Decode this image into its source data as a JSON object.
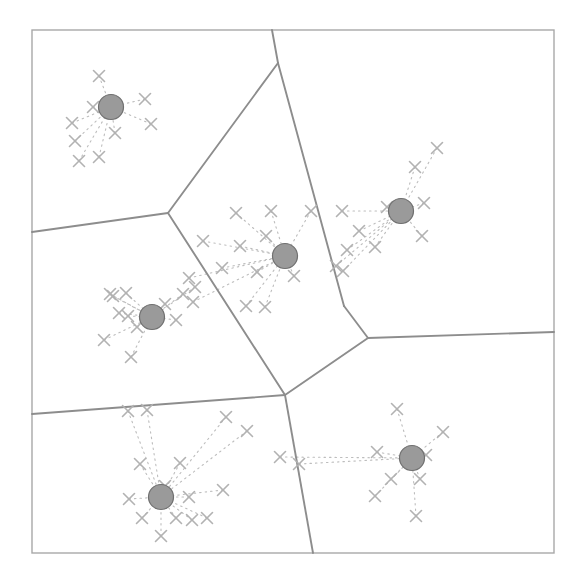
{
  "figure": {
    "title": "Voronoi partition of clustered scatter points",
    "type": "scatter-voronoi-diagram",
    "caption": "",
    "background_color": "#ffffff",
    "frame": {
      "x": 32,
      "y": 30,
      "width": 522,
      "height": 523,
      "stroke_color": "#a8a8a8",
      "stroke_width": 1.4
    },
    "style": {
      "centroid_fill": "#9a9a9a",
      "centroid_stroke": "#6f6f6f",
      "centroid_radius": 12.5,
      "point_color": "#b2b2b2",
      "point_size": 11,
      "boundary_color": "#8d8d8d",
      "boundary_width": 1.9,
      "assignment_line_color": "#bdbdbd",
      "assignment_line_width": 1.1,
      "assignment_dash": "1.5 4"
    }
  },
  "chart_data": {
    "type": "scatter",
    "title": "Voronoi partition of clustered scatter points",
    "xlabel": "",
    "ylabel": "",
    "xlim": [
      32,
      554
    ],
    "ylim": [
      30,
      553
    ],
    "grid": false,
    "legend": "none",
    "cluster_count": 5,
    "point_count": 89,
    "centroids": [
      {
        "id": "c1",
        "label": "cluster-1",
        "x": 111,
        "y": 107
      },
      {
        "id": "c2",
        "label": "cluster-2",
        "x": 401,
        "y": 211
      },
      {
        "id": "c3",
        "label": "cluster-3",
        "x": 285,
        "y": 256
      },
      {
        "id": "c4",
        "label": "cluster-4",
        "x": 152,
        "y": 317
      },
      {
        "id": "c5",
        "label": "cluster-5",
        "x": 412,
        "y": 458
      },
      {
        "id": "c6",
        "label": "cluster-6",
        "x": 161,
        "y": 497
      }
    ],
    "points": [
      {
        "x": 99,
        "y": 76,
        "cluster": "c1"
      },
      {
        "x": 72,
        "y": 123,
        "cluster": "c1"
      },
      {
        "x": 145,
        "y": 99,
        "cluster": "c1"
      },
      {
        "x": 93,
        "y": 107,
        "cluster": "c1"
      },
      {
        "x": 75,
        "y": 141,
        "cluster": "c1"
      },
      {
        "x": 79,
        "y": 161,
        "cluster": "c1"
      },
      {
        "x": 115,
        "y": 133,
        "cluster": "c1"
      },
      {
        "x": 151,
        "y": 124,
        "cluster": "c1"
      },
      {
        "x": 99,
        "y": 157,
        "cluster": "c1"
      },
      {
        "x": 437,
        "y": 148,
        "cluster": "c2"
      },
      {
        "x": 415,
        "y": 167,
        "cluster": "c2"
      },
      {
        "x": 424,
        "y": 203,
        "cluster": "c2"
      },
      {
        "x": 422,
        "y": 236,
        "cluster": "c2"
      },
      {
        "x": 387,
        "y": 207,
        "cluster": "c2"
      },
      {
        "x": 375,
        "y": 247,
        "cluster": "c2"
      },
      {
        "x": 347,
        "y": 250,
        "cluster": "c2"
      },
      {
        "x": 336,
        "y": 266,
        "cluster": "c2"
      },
      {
        "x": 342,
        "y": 211,
        "cluster": "c2"
      },
      {
        "x": 359,
        "y": 231,
        "cluster": "c2"
      },
      {
        "x": 343,
        "y": 271,
        "cluster": "c2"
      },
      {
        "x": 236,
        "y": 213,
        "cluster": "c3"
      },
      {
        "x": 271,
        "y": 211,
        "cluster": "c3"
      },
      {
        "x": 311,
        "y": 211,
        "cluster": "c3"
      },
      {
        "x": 266,
        "y": 236,
        "cluster": "c3"
      },
      {
        "x": 240,
        "y": 246,
        "cluster": "c3"
      },
      {
        "x": 203,
        "y": 241,
        "cluster": "c3"
      },
      {
        "x": 222,
        "y": 268,
        "cluster": "c3"
      },
      {
        "x": 257,
        "y": 272,
        "cluster": "c3"
      },
      {
        "x": 294,
        "y": 276,
        "cluster": "c3"
      },
      {
        "x": 246,
        "y": 306,
        "cluster": "c3"
      },
      {
        "x": 265,
        "y": 307,
        "cluster": "c3"
      },
      {
        "x": 189,
        "y": 278,
        "cluster": "c3"
      },
      {
        "x": 193,
        "y": 302,
        "cluster": "c3"
      },
      {
        "x": 183,
        "y": 294,
        "cluster": "c4"
      },
      {
        "x": 110,
        "y": 294,
        "cluster": "c4"
      },
      {
        "x": 126,
        "y": 293,
        "cluster": "c4"
      },
      {
        "x": 119,
        "y": 313,
        "cluster": "c4"
      },
      {
        "x": 128,
        "y": 316,
        "cluster": "c4"
      },
      {
        "x": 137,
        "y": 327,
        "cluster": "c4"
      },
      {
        "x": 176,
        "y": 320,
        "cluster": "c4"
      },
      {
        "x": 165,
        "y": 304,
        "cluster": "c4"
      },
      {
        "x": 104,
        "y": 340,
        "cluster": "c4"
      },
      {
        "x": 131,
        "y": 357,
        "cluster": "c4"
      },
      {
        "x": 195,
        "y": 287,
        "cluster": "c4"
      },
      {
        "x": 397,
        "y": 409,
        "cluster": "c5"
      },
      {
        "x": 443,
        "y": 432,
        "cluster": "c5"
      },
      {
        "x": 377,
        "y": 452,
        "cluster": "c5"
      },
      {
        "x": 426,
        "y": 455,
        "cluster": "c5"
      },
      {
        "x": 420,
        "y": 479,
        "cluster": "c5"
      },
      {
        "x": 391,
        "y": 479,
        "cluster": "c5"
      },
      {
        "x": 375,
        "y": 496,
        "cluster": "c5"
      },
      {
        "x": 416,
        "y": 516,
        "cluster": "c5"
      },
      {
        "x": 140,
        "y": 464,
        "cluster": "c6"
      },
      {
        "x": 180,
        "y": 463,
        "cluster": "c6"
      },
      {
        "x": 165,
        "y": 486,
        "cluster": "c6"
      },
      {
        "x": 129,
        "y": 499,
        "cluster": "c6"
      },
      {
        "x": 189,
        "y": 497,
        "cluster": "c6"
      },
      {
        "x": 142,
        "y": 518,
        "cluster": "c6"
      },
      {
        "x": 176,
        "y": 518,
        "cluster": "c6"
      },
      {
        "x": 192,
        "y": 520,
        "cluster": "c6"
      },
      {
        "x": 207,
        "y": 518,
        "cluster": "c6"
      },
      {
        "x": 161,
        "y": 536,
        "cluster": "c6"
      },
      {
        "x": 223,
        "y": 490,
        "cluster": "c6"
      },
      {
        "x": 113,
        "y": 296,
        "cluster": "c4"
      },
      {
        "x": 299,
        "y": 464,
        "cluster": "c5"
      },
      {
        "x": 280,
        "y": 457,
        "cluster": "c5"
      },
      {
        "x": 247,
        "y": 431,
        "cluster": "c6"
      },
      {
        "x": 226,
        "y": 417,
        "cluster": "c6"
      },
      {
        "x": 128,
        "y": 411,
        "cluster": "c6"
      },
      {
        "x": 147,
        "y": 410,
        "cluster": "c6"
      }
    ],
    "voronoi_edges": [
      {
        "from": [
          278,
          63
        ],
        "to": [
          272,
          30
        ]
      },
      {
        "from": [
          278,
          63
        ],
        "to": [
          168,
          213
        ]
      },
      {
        "from": [
          278,
          63
        ],
        "to": [
          344,
          306
        ]
      },
      {
        "from": [
          168,
          213
        ],
        "to": [
          32,
          232
        ]
      },
      {
        "from": [
          168,
          213
        ],
        "to": [
          285,
          395
        ]
      },
      {
        "from": [
          344,
          306
        ],
        "to": [
          368,
          338
        ]
      },
      {
        "from": [
          368,
          338
        ],
        "to": [
          554,
          332
        ]
      },
      {
        "from": [
          368,
          338
        ],
        "to": [
          285,
          395
        ]
      },
      {
        "from": [
          285,
          395
        ],
        "to": [
          32,
          414
        ]
      },
      {
        "from": [
          285,
          395
        ],
        "to": [
          313,
          553
        ]
      }
    ]
  }
}
